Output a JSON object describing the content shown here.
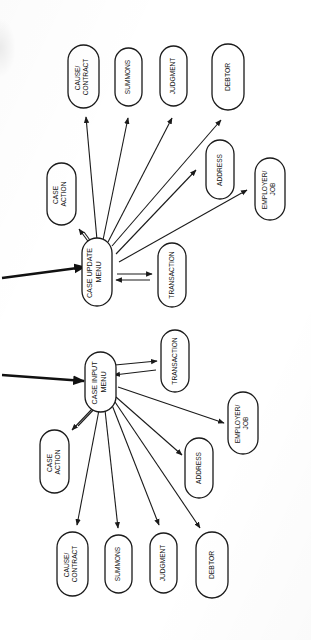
{
  "document": {
    "title": "Case Menu Structure Diagrams",
    "orientation": "rotated-90-clockwise",
    "background_color": "#ffffff",
    "line_color": "#1a1a1a"
  },
  "diagrams": [
    {
      "id": "case-update-menu",
      "root": {
        "label": "CASE UPDATE MENU",
        "lines": [
          "CASE UPDATE",
          "MENU"
        ]
      },
      "entry_arrow": {
        "label": "",
        "style": "thick",
        "direction": "into-root"
      },
      "nodes": [
        {
          "id": "case-action",
          "lines": [
            "CASE",
            "ACTION"
          ],
          "arrow": "bidirectional"
        },
        {
          "id": "cause-contract",
          "lines": [
            "CAUSE/",
            "CONTRACT"
          ],
          "arrow": "root-to-node"
        },
        {
          "id": "summons",
          "lines": [
            "SUMMONS"
          ],
          "arrow": "root-to-node"
        },
        {
          "id": "judgment",
          "lines": [
            "JUDGMENT"
          ],
          "arrow": "root-to-node"
        },
        {
          "id": "debtor",
          "lines": [
            "DEBTOR"
          ],
          "arrow": "root-to-node"
        },
        {
          "id": "address",
          "lines": [
            "ADDRESS"
          ],
          "arrow": "root-to-node"
        },
        {
          "id": "employer-job",
          "lines": [
            "EMPLOYER/",
            "JOB"
          ],
          "arrow": "root-to-node"
        },
        {
          "id": "transaction",
          "lines": [
            "TRANSACTION"
          ],
          "arrow": "bidirectional"
        }
      ]
    },
    {
      "id": "case-input-menu",
      "root": {
        "label": "CASE INPUT MENU",
        "lines": [
          "CASE INPUT",
          "MENU"
        ]
      },
      "entry_arrow": {
        "label": "",
        "style": "thick",
        "direction": "into-root"
      },
      "nodes": [
        {
          "id": "transaction",
          "lines": [
            "TRANSACTION"
          ],
          "arrow": "bidirectional"
        },
        {
          "id": "employer-job",
          "lines": [
            "EMPLOYER/",
            "JOB"
          ],
          "arrow": "root-to-node"
        },
        {
          "id": "address",
          "lines": [
            "ADDRESS"
          ],
          "arrow": "root-to-node"
        },
        {
          "id": "case-action",
          "lines": [
            "CASE",
            "ACTION"
          ],
          "arrow": "bidirectional"
        },
        {
          "id": "cause-contract",
          "lines": [
            "CAUSE/",
            "CONTRACT"
          ],
          "arrow": "root-to-node"
        },
        {
          "id": "summons",
          "lines": [
            "SUMMONS"
          ],
          "arrow": "root-to-node"
        },
        {
          "id": "judgment",
          "lines": [
            "JUDGMENT"
          ],
          "arrow": "root-to-node"
        },
        {
          "id": "debtor",
          "lines": [
            "DEBTOR"
          ],
          "arrow": "root-to-node"
        }
      ]
    }
  ]
}
